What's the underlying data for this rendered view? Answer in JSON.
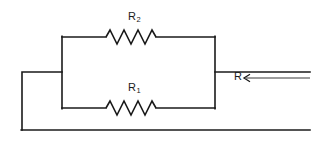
{
  "diagram": {
    "type": "electrical-circuit-schematic",
    "background_color": "#ffffff",
    "line_color": "#1a1a1a",
    "labels": {
      "r2": "R",
      "r2_subscript": "2",
      "r1": "R",
      "r1_subscript": "1",
      "r_equivalent": "R"
    },
    "components": [
      {
        "name": "resistor-r2",
        "label": "R2",
        "branch": "top",
        "zigzag_peaks": 6
      },
      {
        "name": "resistor-r1",
        "label": "R1",
        "branch": "bottom",
        "zigzag_peaks": 6
      }
    ],
    "annotation": {
      "name": "equivalent-resistance-arrow",
      "label": "R",
      "arrow_direction": "left"
    },
    "geometry": {
      "parallel_left_x": 62,
      "parallel_right_x": 215,
      "top_branch_y": 37,
      "bottom_branch_y": 108,
      "mid_lead_y": 72,
      "outer_left_x": 22,
      "bottom_return_y": 130,
      "right_edge_x": 310
    }
  }
}
